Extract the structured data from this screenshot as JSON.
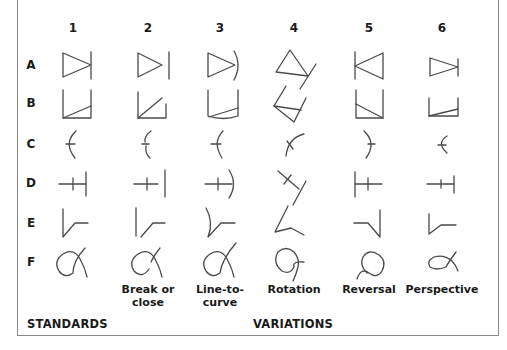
{
  "diagram": {
    "columns": [
      {
        "number": "1",
        "caption": "",
        "x": 73
      },
      {
        "number": "2",
        "caption": "Break or close",
        "x": 148
      },
      {
        "number": "3",
        "caption": "Line-to-curve",
        "x": 220
      },
      {
        "number": "4",
        "caption": "Rotation",
        "x": 294
      },
      {
        "number": "5",
        "caption": "Reversal",
        "x": 369
      },
      {
        "number": "6",
        "caption": "Perspective",
        "x": 442
      }
    ],
    "captions": {
      "c2_line1": "Break or",
      "c2_line2": "close",
      "c3_line1": "Line-to-",
      "c3_line2": "curve",
      "c4": "Rotation",
      "c5": "Reversal",
      "c6": "Perspective"
    },
    "rows": [
      {
        "letter": "A",
        "shape": "triangle-with-bar"
      },
      {
        "letter": "B",
        "shape": "open-box-with-diagonal"
      },
      {
        "letter": "C",
        "shape": "arc-with-tick"
      },
      {
        "letter": "D",
        "shape": "line-with-cross-and-bar"
      },
      {
        "letter": "E",
        "shape": "vertical-with-angled-line"
      },
      {
        "letter": "F",
        "shape": "loop-curve"
      }
    ],
    "section_labels": {
      "standards": "STANDARDS",
      "variations": "VARIATIONS"
    },
    "stroke_color": "#4a4a4a",
    "border_color": "#8a8a8a"
  }
}
